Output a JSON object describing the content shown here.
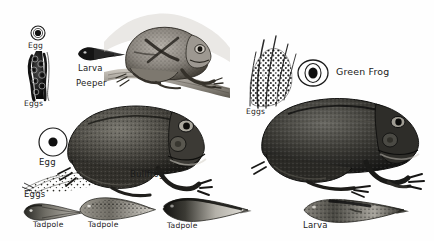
{
  "plate": {
    "title": "Frog life stages engraving plate",
    "background_color": "#fefefe",
    "ink_color": "#1a1a1a",
    "width": 434,
    "height": 241
  },
  "species": [
    {
      "id": "peeper",
      "name_label": "Peeper",
      "egg_label": "Egg",
      "eggs_label": "Eggs",
      "larva_label": "Larva"
    },
    {
      "id": "green-frog",
      "name_label": "Green Frog",
      "eggs_label": "Eggs",
      "larva_label": "Larva"
    },
    {
      "id": "bullfrog",
      "name_label": "Bullfrog",
      "egg_label": "Egg",
      "eggs_label": "Eggs",
      "tadpole_labels": [
        "Tadpole",
        "Tadpole",
        "Tadpole"
      ]
    }
  ],
  "labels": {
    "peeper_egg": "Egg",
    "peeper_eggs": "Eggs",
    "peeper_larva": "Larva",
    "peeper_name": "Peeper",
    "green_frog_name": "Green Frog",
    "green_frog_eggs": "Eggs",
    "green_frog_larva": "Larva",
    "bullfrog_egg": "Egg",
    "bullfrog_eggs": "Eggs",
    "bullfrog_name": "Bullfrog",
    "tadpole_1": "Tadpole",
    "tadpole_2": "Tadpole",
    "tadpole_3": "Tadpole"
  }
}
